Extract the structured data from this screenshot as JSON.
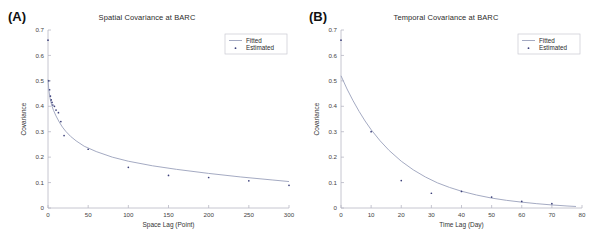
{
  "figure": {
    "panels": [
      {
        "label": "(A)",
        "title": "Spatial Covariance at BARC"
      },
      {
        "label": "(B)",
        "title": "Temporal Covariance at BARC"
      }
    ]
  },
  "legend": {
    "fitted_label": "Fitted",
    "estimated_label": "Estimated"
  },
  "colors": {
    "marker": "#3b3f7a",
    "fit_line": "#9aa0bb",
    "axis": "#b8b8c4",
    "text": "#2b2b2b"
  },
  "chart_data": [
    {
      "type": "scatter",
      "title": "Spatial Covariance at BARC",
      "panel": "(A)",
      "xlabel": "Space Lag (Point)",
      "ylabel": "Covariance",
      "xlim": [
        0,
        300
      ],
      "ylim": [
        0,
        0.7
      ],
      "xticks": [
        0,
        50,
        100,
        150,
        200,
        250,
        300
      ],
      "yticks": [
        0,
        0.1,
        0.2,
        0.3,
        0.4,
        0.5,
        0.6,
        0.7
      ],
      "grid": false,
      "legend_position": "top-right",
      "series": [
        {
          "name": "Estimated",
          "marker": "dot",
          "x": [
            0,
            1,
            2,
            3,
            4,
            5,
            6,
            8,
            10,
            13,
            16,
            20,
            50,
            100,
            150,
            200,
            250,
            300
          ],
          "y": [
            0.66,
            0.5,
            0.465,
            0.44,
            0.425,
            0.415,
            0.405,
            0.4,
            0.385,
            0.375,
            0.34,
            0.285,
            0.231,
            0.16,
            0.128,
            0.12,
            0.107,
            0.089
          ]
        },
        {
          "name": "Fitted",
          "marker": "line",
          "x": [
            0,
            1,
            2,
            3,
            4,
            5,
            7,
            10,
            14,
            18,
            22,
            28,
            35,
            45,
            60,
            80,
            100,
            130,
            160,
            200,
            240,
            280,
            300
          ],
          "y": [
            0.505,
            0.465,
            0.442,
            0.425,
            0.412,
            0.4,
            0.383,
            0.362,
            0.338,
            0.318,
            0.302,
            0.282,
            0.264,
            0.243,
            0.222,
            0.2,
            0.184,
            0.166,
            0.152,
            0.136,
            0.122,
            0.11,
            0.104
          ]
        }
      ]
    },
    {
      "type": "scatter",
      "title": "Temporal Covariance at BARC",
      "panel": "(B)",
      "xlabel": "Time Lag (Day)",
      "ylabel": "Covariance",
      "xlim": [
        0,
        80
      ],
      "ylim": [
        0,
        0.7
      ],
      "xticks": [
        0,
        10,
        20,
        30,
        40,
        50,
        60,
        70,
        80
      ],
      "yticks": [
        0,
        0.1,
        0.2,
        0.3,
        0.4,
        0.5,
        0.6,
        0.7
      ],
      "grid": false,
      "legend_position": "top-right",
      "series": [
        {
          "name": "Estimated",
          "marker": "dot",
          "x": [
            0,
            10,
            20,
            30,
            40,
            50,
            60,
            70
          ],
          "y": [
            0.66,
            0.3,
            0.108,
            0.058,
            0.065,
            0.043,
            0.026,
            0.017
          ]
        },
        {
          "name": "Fitted",
          "marker": "line",
          "x": [
            0,
            2,
            4,
            6,
            8,
            10,
            13,
            16,
            20,
            24,
            28,
            32,
            36,
            40,
            45,
            50,
            55,
            60,
            65,
            70,
            75,
            78
          ],
          "y": [
            0.52,
            0.468,
            0.422,
            0.38,
            0.342,
            0.308,
            0.264,
            0.226,
            0.184,
            0.15,
            0.122,
            0.099,
            0.081,
            0.066,
            0.051,
            0.039,
            0.03,
            0.023,
            0.017,
            0.012,
            0.008,
            0.006
          ]
        }
      ]
    }
  ]
}
